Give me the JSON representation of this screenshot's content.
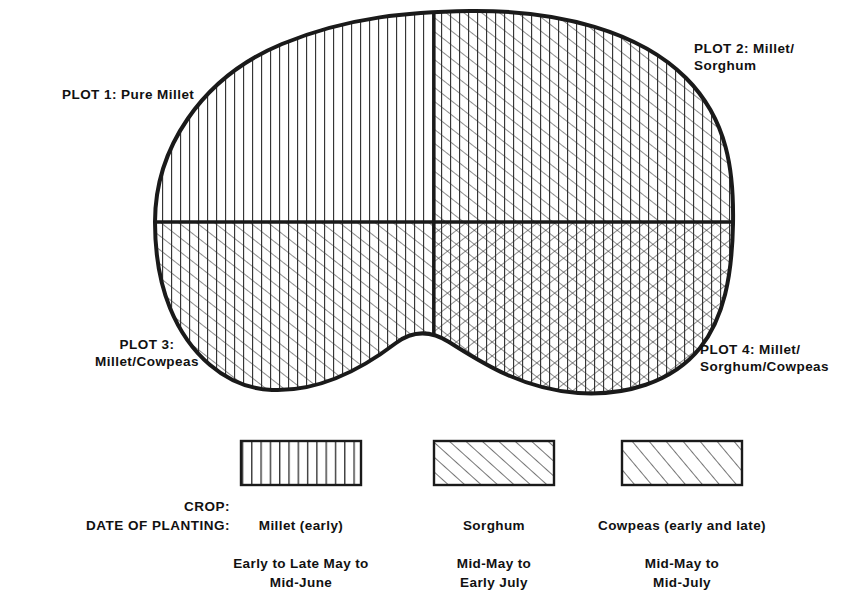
{
  "figure": {
    "plots": [
      {
        "id": "plot-1",
        "label": "PLOT 1: Pure Millet",
        "crops": "Millet",
        "quadrant": "upper-left",
        "fill": "vertical"
      },
      {
        "id": "plot-2",
        "label": "PLOT 2: Millet/\nSorghum",
        "crops": "Millet, Sorghum",
        "quadrant": "upper-right",
        "fill": "vertical + forward-diagonal"
      },
      {
        "id": "plot-3",
        "label": "PLOT 3:\nMillet/Cowpeas",
        "crops": "Millet, Cowpeas",
        "quadrant": "lower-left",
        "fill": "vertical + forward-diagonal"
      },
      {
        "id": "plot-4",
        "label": "PLOT 4: Millet/\nSorghum/Cowpeas",
        "crops": "Millet, Sorghum, Cowpeas",
        "quadrant": "lower-right",
        "fill": "vertical + forward-diagonal + back-diagonal"
      }
    ]
  },
  "legend": {
    "row_labels": {
      "crop": "CROP:",
      "date_of_planting": "DATE OF PLANTING:"
    },
    "columns": [
      {
        "id": "millet",
        "swatch": "vertical-lines-swatch",
        "crop": "Millet (early)",
        "dates": "Early to Late May to\nMid-June"
      },
      {
        "id": "sorghum",
        "swatch": "diagonal-lines-swatch",
        "crop": "Sorghum",
        "dates": "Mid-May to\nEarly July"
      },
      {
        "id": "cowpeas",
        "swatch": "wide-diagonal-lines-swatch",
        "crop": "Cowpeas (early and late)",
        "dates": "Mid-May to\nMid-July"
      }
    ]
  },
  "colors": {
    "ink": "#111111",
    "outline": "#1a1a1a",
    "hatch": "#2b2b2b",
    "background": "#ffffff"
  }
}
